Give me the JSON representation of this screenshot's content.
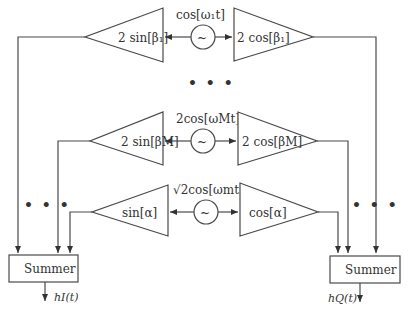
{
  "diagram": {
    "type": "block-diagram",
    "rows": [
      {
        "id": "branch-1",
        "oscillator_label": "cos[ω₁t]",
        "left_gain": "2 sin[β₁]",
        "right_gain": "2 cos[β₁]"
      },
      {
        "id": "branch-M",
        "oscillator_label": "2cos[ωMt]",
        "left_gain": "2 sin[βM]",
        "right_gain": "2 cos[βM]"
      },
      {
        "id": "branch-m",
        "oscillator_label": "√2cos[ωmt]",
        "left_gain": "sin[α]",
        "right_gain": "cos[α]"
      }
    ],
    "oscillator_symbol": "~",
    "ellipsis": "• • •",
    "summers": {
      "left": {
        "label": "Summer",
        "output": "hI(t)"
      },
      "right": {
        "label": "Summer",
        "output": "hQ(t)"
      }
    }
  },
  "colors": {
    "stroke": "#4a4a4a",
    "text": "#333333",
    "background": "#ffffff"
  }
}
